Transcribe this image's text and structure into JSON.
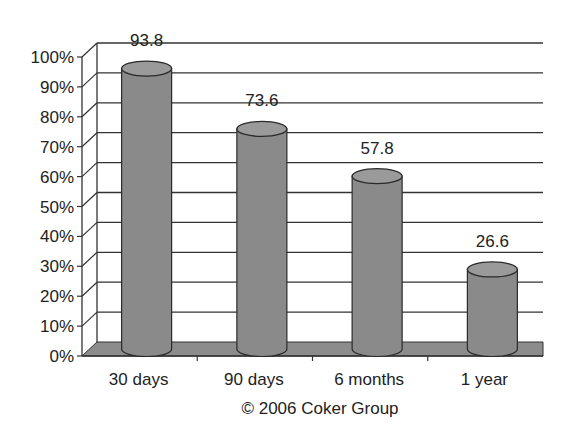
{
  "chart_data": {
    "type": "bar",
    "style": "3d-cylinder",
    "title": "",
    "xlabel": "",
    "ylabel": "",
    "categories": [
      "30 days",
      "90 days",
      "6 months",
      "1 year"
    ],
    "values": [
      93.8,
      73.6,
      57.8,
      26.6
    ],
    "value_labels": [
      "93.8",
      "73.6",
      "57.8",
      "26.6"
    ],
    "ylim": [
      0,
      100
    ],
    "y_ticks": [
      "0%",
      "10%",
      "20%",
      "30%",
      "40%",
      "50%",
      "60%",
      "70%",
      "80%",
      "90%",
      "100%"
    ],
    "grid": true,
    "legend": null,
    "caption": "© 2006 Coker Group"
  },
  "colors": {
    "bar_fill": "#8a8a8a",
    "bar_top": "#9a9a9a",
    "floor": "#8c8c8c",
    "grid": "#333333",
    "text": "#222222"
  }
}
